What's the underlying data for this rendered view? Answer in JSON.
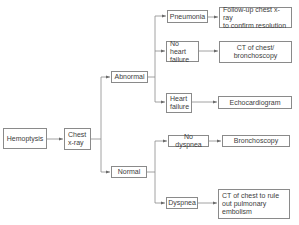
{
  "colors": {
    "line": "#8a8a8a",
    "text": "#3d3d3d",
    "background": "#ffffff"
  },
  "nodes": {
    "hemoptysis": "Hemoptysis",
    "chest_xray": "Chest\nx-ray",
    "abnormal": "Abnormal",
    "normal": "Normal",
    "pneumonia": "Pneumonia",
    "no_heart_failure": "No heart\nfailure",
    "heart_failure": "Heart\nfailure",
    "no_dyspnea": "No dyspnea",
    "dyspnea": "Dyspnea",
    "followup_xray": "Follow-up chest x-ray\nto confirm resolution",
    "ct_bronchoscopy": "CT of chest/\nbronchoscopy",
    "echocardiogram": "Echocardiogram",
    "bronchoscopy": "Bronchoscopy",
    "ct_pe": "CT of chest to rule\nout pulmonary\nembolism"
  }
}
